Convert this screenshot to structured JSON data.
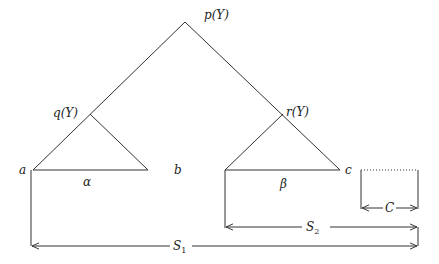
{
  "diagram": {
    "labels": {
      "root": "p(Y)",
      "left_node": "q(Y)",
      "right_node": "r(Y)",
      "leaf_a": "a",
      "leaf_b": "b",
      "leaf_c": "c",
      "alpha": "α",
      "beta": "β",
      "c_width": "C",
      "s1_main": "S",
      "s1_sub": "1",
      "s2_main": "S",
      "s2_sub": "2"
    },
    "colors": {
      "stroke": "#333333",
      "text": "#222222",
      "background": "#ffffff"
    }
  }
}
